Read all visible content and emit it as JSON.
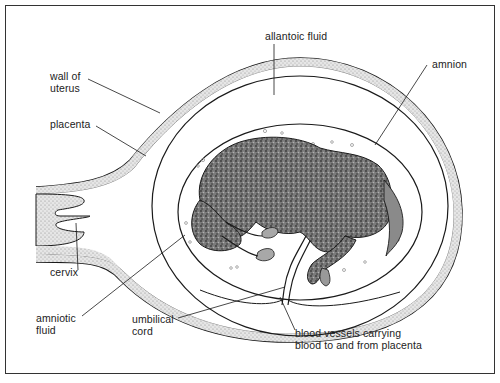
{
  "figure": {
    "colors": {
      "line": "#1a1a1a",
      "stipple": "#bdbdbd",
      "foal_fill": "#6b6b6b",
      "background": "#ffffff",
      "frame": "#333333"
    }
  },
  "labels": {
    "allantoic_fluid": "allantoic fluid",
    "amnion": "amnion",
    "wall_of_uterus_1": "wall of",
    "wall_of_uterus_2": "uterus",
    "placenta": "placenta",
    "cervix": "cervix",
    "amniotic_fluid_1": "amniotic",
    "amniotic_fluid_2": "fluid",
    "umbilical_cord_1": "umbilical",
    "umbilical_cord_2": "cord",
    "blood_vessels_1": "blood vessels carrying",
    "blood_vessels_2": "blood to and from placenta"
  }
}
